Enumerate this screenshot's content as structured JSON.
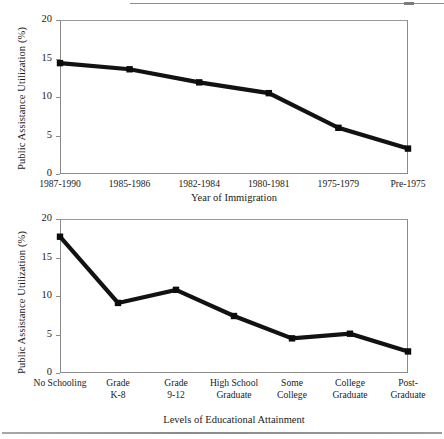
{
  "page": {
    "background": "#ffffff",
    "ink": "#121212"
  },
  "chart_data": [
    {
      "id": "chart-immigration",
      "type": "line",
      "title": "",
      "xlabel": "Year of Immigration",
      "ylabel": "Public Assistance Utilization (%)",
      "categories": [
        "1987-1990",
        "1985-1986",
        "1982-1984",
        "1980-1981",
        "1975-1979",
        "Pre-1975"
      ],
      "values": [
        14.4,
        13.6,
        11.9,
        10.5,
        6.0,
        3.3
      ],
      "ylim": [
        0,
        20
      ],
      "yticks": [
        0,
        5,
        10,
        15,
        20
      ],
      "grid": false,
      "legend": "none",
      "marker": "square",
      "series_color": "#121212"
    },
    {
      "id": "chart-education",
      "type": "line",
      "title": "",
      "xlabel": "Levels of Educational Attainment",
      "ylabel": "Public Assistance Utilization (%)",
      "categories": [
        "No Schooling",
        "Grade\nK-8",
        "Grade\n9-12",
        "High School\nGraduate",
        "Some\nCollege",
        "College\nGraduate",
        "Post-\nGraduate"
      ],
      "values": [
        17.7,
        9.1,
        10.8,
        7.4,
        4.5,
        5.1,
        2.8
      ],
      "ylim": [
        0,
        20
      ],
      "yticks": [
        0,
        5,
        10,
        15,
        20
      ],
      "grid": false,
      "legend": "none",
      "marker": "square",
      "series_color": "#121212"
    }
  ]
}
